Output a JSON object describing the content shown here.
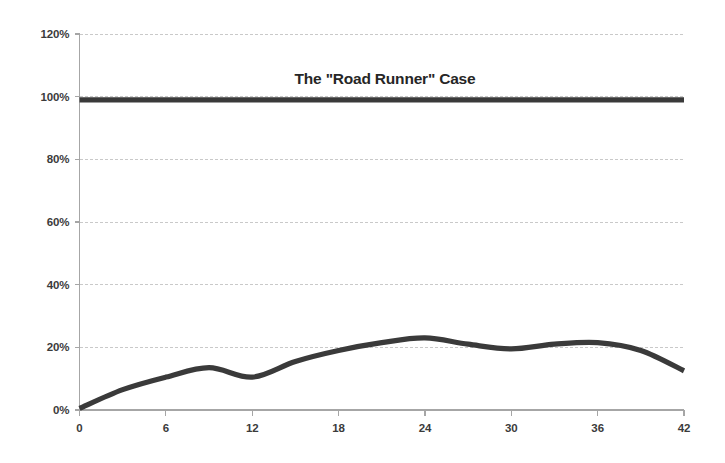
{
  "chart_data": {
    "type": "line",
    "title": "The \"Road Runner\" Case",
    "xlabel": "",
    "ylabel": "",
    "xlim": [
      0,
      42
    ],
    "ylim": [
      0,
      120
    ],
    "xticks": [
      "0",
      "6",
      "12",
      "18",
      "24",
      "30",
      "36",
      "42"
    ],
    "xtick_values": [
      0,
      6,
      12,
      18,
      24,
      30,
      36,
      42
    ],
    "yticks": [
      "0%",
      "20%",
      "40%",
      "60%",
      "80%",
      "100%",
      "120%"
    ],
    "ytick_values": [
      0,
      20,
      40,
      60,
      80,
      100,
      120
    ],
    "grid": "horizontal-dashed",
    "legend": "none",
    "line_color": "#3a3a3a",
    "grid_color": "#c9c9c9",
    "axis_color": "#a6a6a6",
    "text_color": "#3b3b3b",
    "background": "#ffffff",
    "series": [
      {
        "name": "Reference (100%)",
        "style": "flat-line",
        "x": [
          0,
          42
        ],
        "values": [
          99,
          99
        ]
      },
      {
        "name": "Road Runner curve",
        "style": "smooth-line",
        "x": [
          0,
          3,
          6,
          9,
          12,
          15,
          18,
          21,
          24,
          27,
          30,
          33,
          36,
          39,
          42
        ],
        "values": [
          0.5,
          6.5,
          10.5,
          13.5,
          10.5,
          15.5,
          19.0,
          21.5,
          23.0,
          21.0,
          19.5,
          21.0,
          21.5,
          19.0,
          12.5
        ]
      }
    ]
  }
}
